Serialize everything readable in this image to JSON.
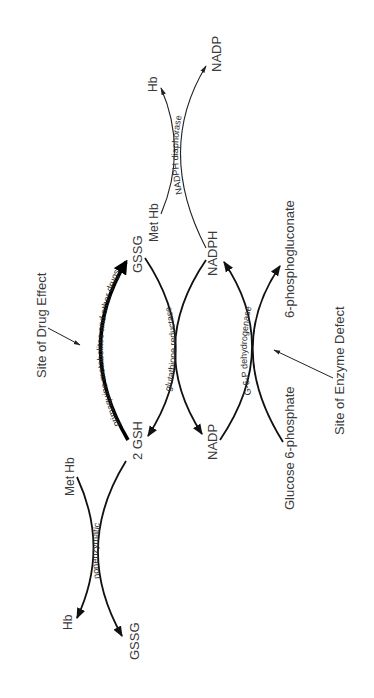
{
  "figure": {
    "orientation": "rotated-90-ccw"
  },
  "nodes": {
    "gssg_top": "GSSG",
    "gsh": "2 GSH",
    "nadph": "NADPH",
    "nadp_mid": "NADP",
    "phosphogluconate": "6-phosphogluconate",
    "glucose6p": "Glucose 6-phosphate",
    "methb_top": "Met Hb",
    "hb_top": "Hb",
    "nadp_top": "NADP",
    "methb_bottom": "Met Hb",
    "hb_bottom": "Hb",
    "gssg_bottom": "GSSG"
  },
  "enzymes": {
    "drug": "primaquine metabolites and other drugs",
    "gr": "glutathione reductase",
    "g6pd": "G-6-P dehydrogenase",
    "diaphorase": "NADPH diaphorase",
    "nonenzymatic": "nonenzymatic"
  },
  "annotations": {
    "drug_site": "Site of Drug Effect",
    "enzyme_site": "Site of Enzyme Defect"
  },
  "colors": {
    "line": "#111111",
    "text": "#3a3a3a",
    "background": "#ffffff"
  }
}
